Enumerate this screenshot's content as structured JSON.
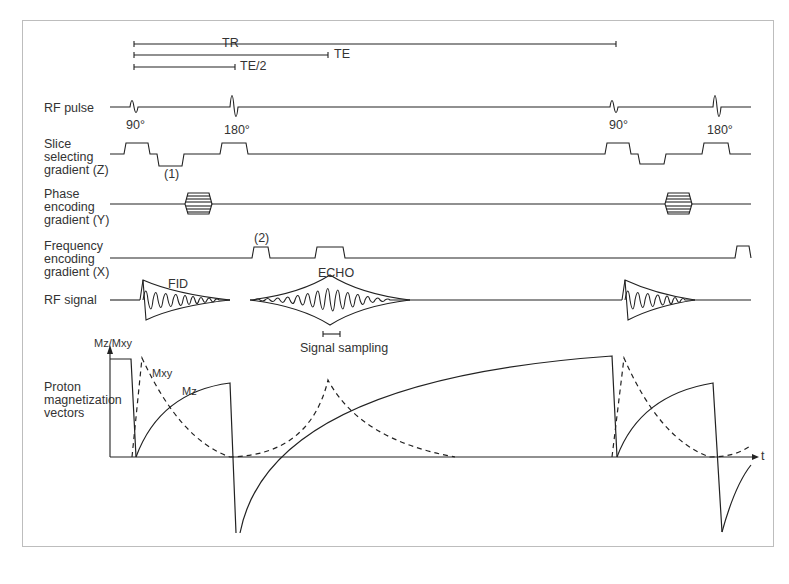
{
  "timing": {
    "tr_label": "TR",
    "te_label": "TE",
    "te_half_label": "TE/2"
  },
  "rows": {
    "rf_pulse": "RF pulse",
    "slice": "Slice\nselecting\ngradient (Z)",
    "phase": "Phase\nencoding\ngradient (Y)",
    "frequency": "Frequency\nencoding\ngradient (X)",
    "rf_signal": "RF signal",
    "proton": "Proton\nmagnetization\nvectors"
  },
  "annotations": {
    "pulse_90": "90°",
    "pulse_180": "180°",
    "slice_note": "(1)",
    "freq_note": "(2)",
    "fid": "FID",
    "echo": "ECHO",
    "signal_sampling": "Signal sampling",
    "y_axis": "Mz/Mxy",
    "mxy": "Mxy",
    "mz": "Mz",
    "t_axis": "t"
  },
  "colors": {
    "line": "#222222",
    "frame": "#bdbdbd"
  }
}
